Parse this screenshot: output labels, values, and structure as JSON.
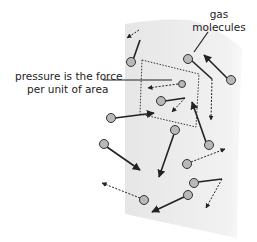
{
  "diagram": {
    "labels": {
      "pressure_line1": "pressure is the force",
      "pressure_line2": "per unit of area",
      "gas_line1": "gas",
      "gas_line2": "molecules"
    },
    "colors": {
      "wall": "#ececec",
      "molecule_fill": "#b8b8b8",
      "molecule_stroke": "#333333",
      "line": "#222222"
    }
  }
}
